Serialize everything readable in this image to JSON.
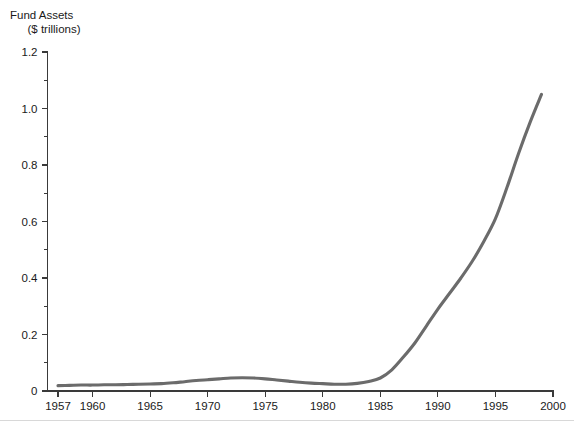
{
  "chart_data": {
    "type": "line",
    "title": "",
    "ylabel_line1": "Fund Assets",
    "ylabel_line2": "($ trillions)",
    "xlabel": "",
    "xlim": [
      1957,
      2000
    ],
    "ylim": [
      0,
      1.2
    ],
    "grid": false,
    "legend": "none",
    "line_color": "#6b6b6b",
    "axis_color": "#3a3a3a",
    "y_ticks_major": [
      "0",
      "0.2",
      "0.4",
      "0.6",
      "0.8",
      "1.0",
      "1.2"
    ],
    "y_ticks_major_values": [
      0,
      0.2,
      0.4,
      0.6,
      0.8,
      1.0,
      1.2
    ],
    "y_ticks_minor_values": [
      0.1,
      0.3,
      0.5,
      0.7,
      0.9,
      1.1
    ],
    "x_ticks": [
      "1957",
      "1960",
      "1965",
      "1970",
      "1975",
      "1980",
      "1985",
      "1990",
      "1995",
      "2000"
    ],
    "x_ticks_values": [
      1957,
      1960,
      1965,
      1970,
      1975,
      1980,
      1985,
      1990,
      1995,
      2000
    ],
    "series": [
      {
        "name": "Fund Assets",
        "x": [
          1957,
          1958,
          1959,
          1960,
          1961,
          1962,
          1963,
          1964,
          1965,
          1966,
          1967,
          1968,
          1969,
          1970,
          1971,
          1972,
          1973,
          1974,
          1975,
          1976,
          1977,
          1978,
          1979,
          1980,
          1981,
          1982,
          1983,
          1984,
          1985,
          1986,
          1987,
          1988,
          1989,
          1990,
          1991,
          1992,
          1993,
          1994,
          1995,
          1996,
          1997,
          1998,
          1999
        ],
        "values": [
          0.019,
          0.02,
          0.021,
          0.021,
          0.022,
          0.022,
          0.023,
          0.024,
          0.025,
          0.026,
          0.029,
          0.033,
          0.037,
          0.04,
          0.043,
          0.046,
          0.047,
          0.046,
          0.043,
          0.039,
          0.035,
          0.031,
          0.028,
          0.026,
          0.024,
          0.024,
          0.027,
          0.034,
          0.046,
          0.075,
          0.12,
          0.17,
          0.23,
          0.29,
          0.345,
          0.4,
          0.46,
          0.53,
          0.61,
          0.72,
          0.84,
          0.95,
          1.05
        ]
      }
    ]
  },
  "footer": {
    "rule_color": "#d8d8d8"
  }
}
